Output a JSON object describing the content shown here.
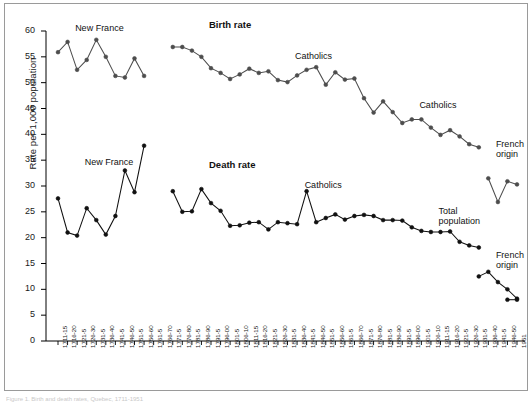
{
  "figure": {
    "caption_fragment": "Figure 1.  Birth and death rates, Quebec, 1711-1951"
  },
  "chart_data": {
    "type": "line",
    "title": "",
    "xlabel": "",
    "ylabel": "Rate per 1,000 population",
    "ylim": [
      0,
      60
    ],
    "yticks": [
      0,
      5,
      10,
      15,
      20,
      25,
      30,
      35,
      40,
      45,
      50,
      55,
      60
    ],
    "grid": false,
    "legend": "inline annotations",
    "annotations": [
      {
        "text": "New France",
        "series": "birth",
        "x": "1721-5",
        "y": 59.5
      },
      {
        "text": "Birth rate",
        "series": "birth",
        "x": "1791-5",
        "y": 60.0,
        "bold": true
      },
      {
        "text": "Catholics",
        "series": "birth",
        "x": "1836-40",
        "y": 54.0
      },
      {
        "text": "Catholics",
        "series": "birth",
        "x": "1901-5",
        "y": 44.5
      },
      {
        "text": "French\norigin",
        "series": "birth",
        "x": "1941-5",
        "y": 37.0
      },
      {
        "text": "New France",
        "series": "death",
        "x": "1726-30",
        "y": 33.5
      },
      {
        "text": "Death rate",
        "series": "death",
        "x": "1791-5",
        "y": 33.0,
        "bold": true
      },
      {
        "text": "Catholics",
        "series": "death",
        "x": "1841-5",
        "y": 29.0
      },
      {
        "text": "Total\npopulation",
        "series": "death",
        "x": "1911-15",
        "y": 24.0
      },
      {
        "text": "French\norigin",
        "series": "death",
        "x": "1941-5",
        "y": 15.5
      }
    ],
    "categories": [
      "1711-15",
      "1716-20",
      "1721-5",
      "1726-30",
      "1731-5",
      "1736-40",
      "1741-5",
      "1746-50",
      "1751-5",
      "1756-60",
      "1761-5",
      "1766-70",
      "1771-5",
      "1776-80",
      "1781-5",
      "1786-90",
      "1791-5",
      "1796-00",
      "1801-5",
      "1806-10",
      "1811-15",
      "1816-20",
      "1821-5",
      "1826-30",
      "1831-5",
      "1836-40",
      "1841-5",
      "1846-50",
      "1851-5",
      "1856-60",
      "1861-5",
      "1866-70",
      "1871-5",
      "1876-80",
      "1881-5",
      "1886-90",
      "1891-5",
      "1896-00",
      "1901-5",
      "1906-10",
      "1911-15",
      "1916-20",
      "1921-5",
      "1926-30",
      "1931-5",
      "1936-40",
      "1941-5",
      "1946-50",
      "1951"
    ],
    "series": [
      {
        "name": "Birth rate",
        "color": "#4d4d4d",
        "marker": "circle",
        "segments": [
          {
            "label": "New France",
            "categories": [
              "1711-15",
              "1716-20",
              "1721-5",
              "1726-30",
              "1731-5",
              "1736-40",
              "1741-5",
              "1746-50",
              "1751-5",
              "1756-60"
            ],
            "values": [
              55.9,
              57.9,
              52.5,
              54.4,
              58.3,
              55.0,
              51.3,
              51.0,
              54.7,
              51.3
            ]
          },
          {
            "label": "Catholics",
            "categories": [
              "1771-5",
              "1776-80",
              "1781-5",
              "1786-90",
              "1791-5",
              "1796-00",
              "1801-5",
              "1806-10",
              "1811-15",
              "1816-20",
              "1821-5",
              "1826-30",
              "1831-5",
              "1836-40",
              "1841-5",
              "1846-50",
              "1851-5",
              "1856-60",
              "1861-5",
              "1866-70",
              "1871-5",
              "1876-80",
              "1881-5",
              "1886-90",
              "1891-5",
              "1896-00",
              "1901-5",
              "1906-10",
              "1911-15",
              "1916-20",
              "1921-5",
              "1926-30",
              "1931-5"
            ],
            "values": [
              56.9,
              56.9,
              56.2,
              55.0,
              52.8,
              51.9,
              50.7,
              51.6,
              52.7,
              51.9,
              52.2,
              50.5,
              50.1,
              51.4,
              52.5,
              53.0,
              49.6,
              52.0,
              50.6,
              50.8,
              47.0,
              44.2,
              46.4,
              44.3,
              42.2,
              42.9,
              42.9,
              41.3,
              39.9,
              40.8,
              39.6,
              38.1,
              37.5
            ]
          },
          {
            "label": "French origin",
            "categories": [
              "1936-40",
              "1941-5",
              "1946-50",
              "1951"
            ],
            "values": [
              31.5,
              26.9,
              30.9,
              30.3
            ]
          }
        ]
      },
      {
        "name": "Death rate",
        "color": "#111111",
        "marker": "circle-filled",
        "segments": [
          {
            "label": "New France",
            "categories": [
              "1711-15",
              "1716-20",
              "1721-5",
              "1726-30",
              "1731-5",
              "1736-40",
              "1741-5",
              "1746-50",
              "1751-5",
              "1756-60"
            ],
            "values": [
              27.6,
              21.0,
              20.4,
              25.7,
              23.4,
              20.6,
              24.2,
              33.0,
              28.8,
              37.8
            ]
          },
          {
            "label": "Catholics",
            "categories": [
              "1771-5",
              "1776-80",
              "1781-5",
              "1786-90",
              "1791-5",
              "1796-00",
              "1801-5",
              "1806-10",
              "1811-15",
              "1816-20",
              "1821-5",
              "1826-30",
              "1831-5",
              "1836-40",
              "1841-5",
              "1846-50",
              "1851-5",
              "1856-60",
              "1861-5",
              "1866-70",
              "1871-5",
              "1876-80",
              "1881-5",
              "1886-90",
              "1891-5",
              "1896-00",
              "1901-5",
              "1906-10",
              "1911-15",
              "1916-20",
              "1921-5",
              "1926-30",
              "1931-5"
            ],
            "values": [
              29.0,
              25.0,
              25.1,
              29.4,
              26.7,
              25.2,
              22.3,
              22.4,
              22.9,
              23.0,
              21.6,
              23.0,
              22.8,
              22.6,
              29.0,
              23.0,
              23.8,
              24.5,
              23.5,
              24.2,
              24.4,
              24.2,
              23.4,
              23.4,
              23.3,
              22.0,
              21.3,
              21.1,
              21.1,
              21.2,
              19.2,
              18.5,
              18.1
            ]
          },
          {
            "label": "Total population / French origin",
            "categories": [
              "1931-5",
              "1936-40",
              "1941-5",
              "1946-50",
              "1951"
            ],
            "values": [
              12.5,
              13.4,
              11.4,
              10.0,
              8.2
            ]
          },
          {
            "label": "French origin tail",
            "categories": [
              "1946-50",
              "1951"
            ],
            "values": [
              8.0,
              8.0
            ]
          }
        ]
      }
    ]
  }
}
